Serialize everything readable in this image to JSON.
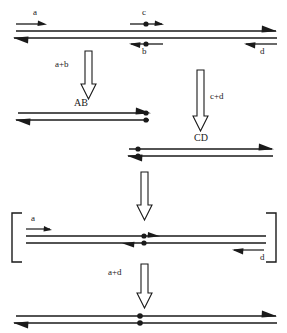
{
  "diagram": {
    "ink_color": "#1a1a1a",
    "stages": [
      {
        "id": "stage-1",
        "name": "parental-duplex",
        "labels": [
          "a",
          "c",
          "b",
          "d"
        ]
      },
      {
        "id": "stage-2",
        "name": "products-ab-cd",
        "labels": [
          "AB",
          "CD"
        ]
      },
      {
        "id": "stage-3",
        "name": "bracketed-intermediate",
        "labels": [
          "a",
          "d"
        ]
      },
      {
        "id": "stage-4",
        "name": "final-duplex",
        "labels": []
      }
    ],
    "reaction_arrows": [
      {
        "id": "arrow-ab",
        "label": "a+b"
      },
      {
        "id": "arrow-cd",
        "label": "c+d"
      },
      {
        "id": "arrow-join",
        "label": ""
      },
      {
        "id": "arrow-ad",
        "label": "a+d"
      }
    ],
    "segment_labels": {
      "a_top_left": "a",
      "c_top_mid": "c",
      "b_bottom_mid": "b",
      "d_bottom_right": "d",
      "ab_product": "AB",
      "cd_product": "CD",
      "a_bracket_left": "a",
      "d_bracket_right": "d",
      "reaction_ab": "a+b",
      "reaction_cd": "c+d",
      "reaction_ad": "a+d"
    }
  }
}
